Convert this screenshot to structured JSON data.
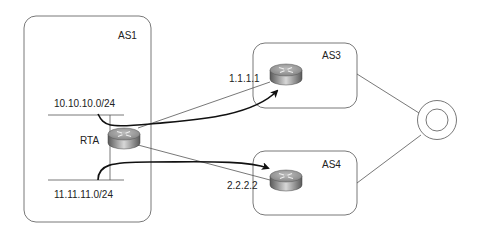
{
  "diagram": {
    "type": "network-topology",
    "autonomous_systems": [
      {
        "id": "as1",
        "label": "AS1"
      },
      {
        "id": "as3",
        "label": "AS3"
      },
      {
        "id": "as4",
        "label": "AS4"
      }
    ],
    "networks": [
      {
        "id": "net10",
        "label": "10.10.10.0/24"
      },
      {
        "id": "net11",
        "label": "11.11.11.0/24"
      }
    ],
    "routers": [
      {
        "id": "rta",
        "label": "RTA"
      },
      {
        "id": "as3-router",
        "label": "1.1.1.1"
      },
      {
        "id": "as4-router",
        "label": "2.2.2.2"
      }
    ],
    "cloud": {
      "label": ""
    },
    "flows": [
      {
        "from": "10.10.10.0/24",
        "to": "1.1.1.1"
      },
      {
        "from": "11.11.11.0/24",
        "to": "2.2.2.2"
      }
    ]
  },
  "colors": {
    "stroke": "#555555",
    "arrow": "#111111",
    "router_top": "#9a9a9a",
    "router_side": "#6e6e6e"
  }
}
